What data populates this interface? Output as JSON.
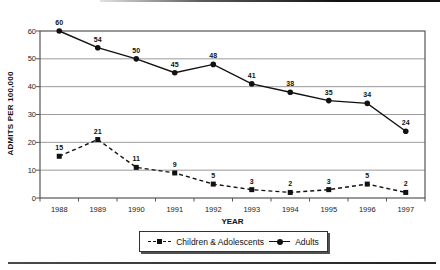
{
  "chart_data": {
    "type": "line",
    "title": "",
    "xlabel": "YEAR",
    "ylabel": "ADMITS PER 100,000",
    "categories": [
      "1988",
      "1989",
      "1990",
      "1991",
      "1992",
      "1993",
      "1994",
      "1995",
      "1996",
      "1997"
    ],
    "y_ticks": [
      0,
      10,
      20,
      30,
      40,
      50,
      60
    ],
    "ylim": [
      0,
      60
    ],
    "grid": "horizontal",
    "legend_position": "bottom",
    "show_data_labels": true,
    "series": [
      {
        "name": "Children & Adolescents",
        "marker": "square",
        "line_style": "dashed",
        "values": [
          15,
          21,
          11,
          9,
          5,
          3,
          2,
          3,
          5,
          2
        ],
        "color": "#111111"
      },
      {
        "name": "Adults",
        "marker": "circle",
        "line_style": "solid",
        "values": [
          60,
          54,
          50,
          45,
          48,
          41,
          38,
          35,
          34,
          24
        ],
        "color": "#111111"
      }
    ],
    "colors": {
      "gridline": "#9a9a9a",
      "plot_border": "#555555",
      "text": "#111111"
    }
  }
}
